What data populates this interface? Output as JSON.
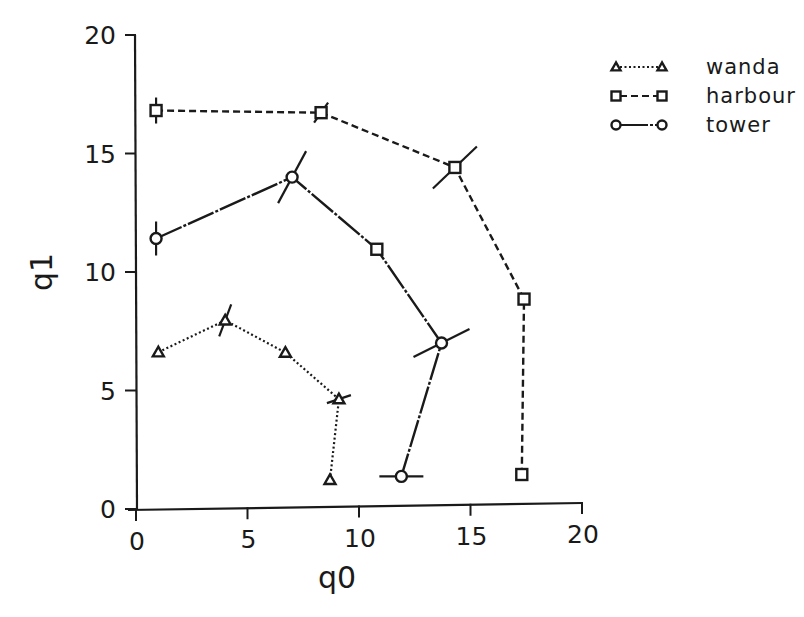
{
  "chart_data": {
    "type": "line",
    "title": "",
    "xlabel": "q0",
    "ylabel": "q1",
    "xlim": [
      0,
      20
    ],
    "ylim": [
      0,
      20
    ],
    "xticks": [
      0,
      5,
      10,
      15,
      20
    ],
    "yticks": [
      0,
      5,
      10,
      15,
      20
    ],
    "grid": false,
    "legend_position": "upper right",
    "series": [
      {
        "name": "wanda",
        "marker": "triangle",
        "linestyle": "dotted",
        "points": [
          {
            "x": 1.0,
            "y": 6.6
          },
          {
            "x": 4.0,
            "y": 7.9
          },
          {
            "x": 6.7,
            "y": 6.5
          },
          {
            "x": 9.1,
            "y": 4.5
          },
          {
            "x": 8.7,
            "y": 1.1
          }
        ]
      },
      {
        "name": "harbour",
        "marker": "square",
        "linestyle": "dashed",
        "points": [
          {
            "x": 0.9,
            "y": 16.8
          },
          {
            "x": 8.3,
            "y": 16.6
          },
          {
            "x": 14.3,
            "y": 14.2
          },
          {
            "x": 17.4,
            "y": 8.6
          },
          {
            "x": 17.3,
            "y": 1.2
          }
        ]
      },
      {
        "name": "tower",
        "marker": "circle",
        "linestyle": "solid",
        "points": [
          {
            "x": 0.9,
            "y": 11.4
          },
          {
            "x": 7.0,
            "y": 13.9
          },
          {
            "x": 10.8,
            "y": 10.8
          },
          {
            "x": 13.7,
            "y": 6.8
          },
          {
            "x": 11.9,
            "y": 1.2
          }
        ]
      }
    ]
  },
  "axes": {
    "x_title": "q0",
    "y_title": "q1",
    "x_tick_labels": [
      "0",
      "5",
      "10",
      "15",
      "20"
    ],
    "y_tick_labels": [
      "0",
      "5",
      "10",
      "15",
      "20"
    ]
  },
  "legend": {
    "items": [
      {
        "label": "wanda",
        "marker": "triangle-icon",
        "linestyle": "dotted"
      },
      {
        "label": "harbour",
        "marker": "square-icon",
        "linestyle": "dashed"
      },
      {
        "label": "tower",
        "marker": "circle-icon",
        "linestyle": "solid"
      }
    ]
  },
  "colors": {
    "ink": "#1a1a1a",
    "background": "#ffffff"
  }
}
